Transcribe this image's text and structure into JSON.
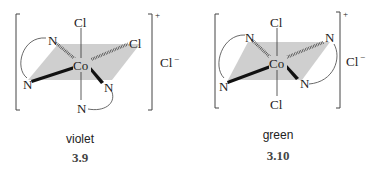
{
  "structures": [
    {
      "id": "3.9",
      "caption": "violet",
      "number": "3.9",
      "isomer": "cis",
      "center": "Co",
      "ligands": {
        "axial_top": "Cl",
        "axial_bottom": "N",
        "eq_back_left": "N",
        "eq_back_right": "Cl",
        "eq_front_left": "N",
        "eq_front_right": "N"
      },
      "charge": "+",
      "counterion": "Cl",
      "counterion_charge": "−"
    },
    {
      "id": "3.10",
      "caption": "green",
      "number": "3.10",
      "isomer": "trans",
      "center": "Co",
      "ligands": {
        "axial_top": "Cl",
        "axial_bottom": "Cl",
        "eq_back_left": "N",
        "eq_back_right": "N",
        "eq_front_left": "N",
        "eq_front_right": "N"
      },
      "charge": "+",
      "counterion": "Cl",
      "counterion_charge": "−"
    }
  ],
  "colors": {
    "plane_fill": "#cfcfcf",
    "ink": "#222222"
  }
}
